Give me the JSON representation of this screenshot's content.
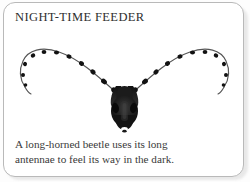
{
  "card": {
    "title": "NIGHT-TIME FEEDER",
    "caption_lines": [
      "A long-horned beetle uses its long",
      "antennae to feel its way in the dark."
    ],
    "caption_full": "A long-horned beetle uses its long antennae to feel its way in the dark.",
    "illustration": {
      "subject": "long-horned-beetle-head",
      "description": "Front view of a long-horned beetle head with two very long beaded antennae sweeping up and outward in a wide V shape",
      "antenna_bead_count_per_side": 9,
      "parts": [
        "left-antenna",
        "right-antenna",
        "head",
        "left-mandible",
        "right-mandible",
        "mouthparts"
      ]
    },
    "colors": {
      "card_background": "#ffffff",
      "card_border": "#b9b9b9",
      "page_background": "#fdfdfd",
      "title_text": "#2e2e2e",
      "caption_text": "#3a3a3a",
      "ink_dark": "#141414",
      "ink_mid": "#4a4a4a",
      "antenna_line": "#555555",
      "highlight": "#ffffff"
    }
  }
}
